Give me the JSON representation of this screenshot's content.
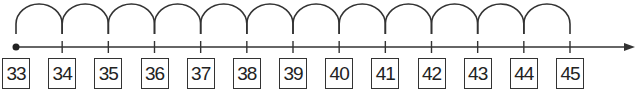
{
  "number_line": {
    "start": 33,
    "end": 45,
    "step": 1,
    "labels": [
      "33",
      "34",
      "35",
      "36",
      "37",
      "38",
      "39",
      "40",
      "41",
      "42",
      "43",
      "44",
      "45"
    ],
    "jumps": 12,
    "start_marker": "filled-dot",
    "end_marker": "arrow-right",
    "colors": {
      "line": "#333333",
      "box_border": "#333333",
      "text": "#222222"
    }
  }
}
